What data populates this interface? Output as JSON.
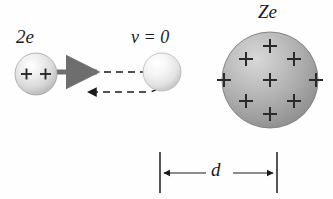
{
  "figure": {
    "background_color": "#fefefe",
    "width": 333,
    "height": 199
  },
  "labels": {
    "alpha_charge": "2e",
    "velocity_at_turning_point": "v = 0",
    "nucleus_charge": "Ze",
    "distance": "d"
  },
  "colors": {
    "ink": "#1a1a1a",
    "incoming_arrow": "#6e6e6e",
    "small_sphere_light": "#f4f4f4",
    "small_sphere_mid": "#d0d0d0",
    "small_sphere_edge": "#9a9a9a",
    "large_sphere_light": "#c9c9c9",
    "large_sphere_mid": "#a0a0a0",
    "large_sphere_edge": "#787878",
    "dimension_line": "#2a2a2a"
  },
  "elements": {
    "alpha_particle_start": {
      "name": "alpha-particle-incoming",
      "cx": 36,
      "cy": 74,
      "r": 21,
      "plus_signs": 2,
      "plus_positions": [
        [
          27,
          74
        ],
        [
          45,
          74
        ]
      ]
    },
    "alpha_particle_turning": {
      "name": "alpha-particle-at-rest",
      "cx": 160,
      "cy": 72,
      "r": 19,
      "plus_signs": 0
    },
    "nucleus": {
      "name": "nucleus",
      "cx": 270,
      "cy": 80,
      "r": 48,
      "plus_signs": 9,
      "plus_positions": [
        [
          270,
          45
        ],
        [
          246,
          58
        ],
        [
          294,
          58
        ],
        [
          224,
          80
        ],
        [
          270,
          80
        ],
        [
          316,
          80
        ],
        [
          246,
          102
        ],
        [
          294,
          102
        ],
        [
          270,
          114
        ]
      ]
    },
    "incoming_arrow": {
      "name": "incoming-velocity-arrow",
      "from_x": 57,
      "to_x": 100,
      "y": 72,
      "style": "solid",
      "color": "#6e6e6e"
    },
    "incoming_dashed_path": {
      "name": "incoming-trajectory-dashed",
      "from_x": 100,
      "to_x": 150,
      "y": 72,
      "style": "dashed"
    },
    "turnaround_curve": {
      "name": "turnaround-trajectory",
      "description": "dashed U-turn around left edge of stationary particle"
    },
    "outgoing_arrow": {
      "name": "outgoing-trajectory-arrow",
      "from_x": 140,
      "to_x": 85,
      "y": 92,
      "style": "dashed",
      "direction": "left"
    },
    "dimension": {
      "name": "distance-of-closest-approach",
      "left_tick_x": 160,
      "right_tick_x": 277,
      "tick_top_y": 152,
      "tick_bottom_y": 193,
      "arrow_y": 173,
      "label": "d"
    }
  }
}
